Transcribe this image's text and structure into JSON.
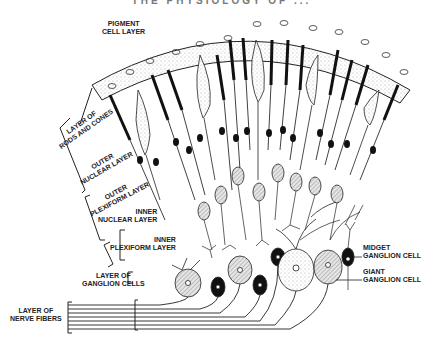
{
  "header": {
    "title": "THE PHYSIOLOGY OF ..."
  },
  "labels": {
    "pigment": [
      "PIGMENT",
      "CELL LAYER"
    ],
    "rods_cones": [
      "LAYER OF",
      "RODS AND CONES"
    ],
    "outer_nuclear": [
      "OUTER",
      "NUCLEAR LAYER"
    ],
    "outer_plexiform": [
      "OUTER",
      "PLEXIFORM LAYER"
    ],
    "inner_nuclear": [
      "INNER",
      "NUCLEAR LAYER"
    ],
    "inner_plexiform": [
      "INNER",
      "PLEXIFORM LAYER"
    ],
    "ganglion_cells": [
      "LAYER OF",
      "GANGLION CELLS"
    ],
    "nerve_fibers": [
      "LAYER OF",
      "NERVE FIBERS"
    ],
    "midget": [
      "MIDGET",
      "GANGLION CELL"
    ],
    "giant": [
      "GIANT",
      "GANGLION CELL"
    ]
  },
  "colors": {
    "ink": "#1a1a1a",
    "stipple": "#d8d8d8",
    "hatch": "#9a9a9a",
    "paper": "#ffffff"
  }
}
